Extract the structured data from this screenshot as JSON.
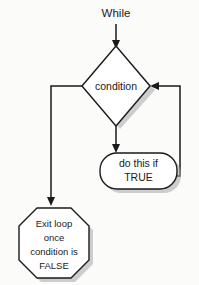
{
  "diagram": {
    "type": "flowchart",
    "background_color": "#fbfbfa",
    "shape_fill": "#ffffff",
    "stroke_color": "#1a1a1a",
    "shadow_color": "#a8a8a8",
    "nodes": {
      "start": {
        "label": "While",
        "shape": "text"
      },
      "condition": {
        "label": "condition",
        "shape": "diamond"
      },
      "action": {
        "label_line1": "do this if",
        "label_line2": "TRUE",
        "shape": "rounded-rectangle"
      },
      "exit": {
        "label_line1": "Exit loop",
        "label_line2": "once",
        "label_line3": "condition is",
        "label_line4": "FALSE",
        "shape": "octagon"
      }
    },
    "edges": [
      {
        "name": "start-to-condition",
        "from": "start",
        "to": "condition",
        "label": ""
      },
      {
        "name": "condition-to-action",
        "from": "condition",
        "to": "action",
        "label": ""
      },
      {
        "name": "condition-to-exit",
        "from": "condition",
        "to": "exit",
        "label": ""
      },
      {
        "name": "action-back-to-condition",
        "from": "action",
        "to": "condition",
        "label": ""
      }
    ]
  }
}
